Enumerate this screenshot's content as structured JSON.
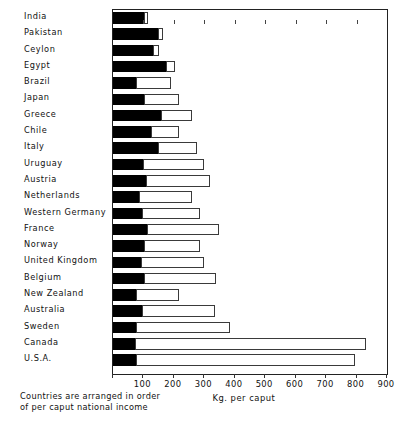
{
  "chart_data": {
    "type": "bar",
    "orientation": "horizontal",
    "stacked": true,
    "title": "",
    "xlabel": "Kg. per caput",
    "ylabel": "",
    "xlim": [
      0,
      900
    ],
    "xticks": [
      0,
      100,
      200,
      300,
      400,
      500,
      600,
      700,
      800,
      900
    ],
    "xtick_labels": [
      "",
      "100",
      "200",
      "300",
      "400",
      "500",
      "600",
      "700",
      "800",
      "900"
    ],
    "grid": false,
    "legend": [],
    "note": "Countries are arranged in order of per caput national income",
    "note_line1": "Countries are arranged in order",
    "note_line2": "of per caput national income",
    "categories": [
      "India",
      "Pakistan",
      "Ceylon",
      "Egypt",
      "Brazil",
      "Japan",
      "Greece",
      "Chile",
      "Italy",
      "Uruguay",
      "Austria",
      "Netherlands",
      "Western Germany",
      "France",
      "Norway",
      "United Kingdom",
      "Belgium",
      "New Zealand",
      "Australia",
      "Sweden",
      "Canada",
      "U.S.A."
    ],
    "series": [
      {
        "name": "dark-segment",
        "color": "#000000",
        "values": [
          102,
          148,
          131,
          174,
          75,
          102,
          158,
          125,
          148,
          99,
          108,
          85,
          95,
          112,
          102,
          92,
          102,
          75,
          95,
          75,
          72,
          75
        ]
      },
      {
        "name": "light-segment",
        "color": "#ffffff",
        "values": [
          13,
          16,
          20,
          30,
          115,
          115,
          102,
          92,
          128,
          200,
          212,
          174,
          191,
          236,
          184,
          207,
          236,
          142,
          240,
          309,
          760,
          720
        ]
      }
    ],
    "totals": [
      115,
      164,
      151,
      204,
      190,
      217,
      260,
      217,
      276,
      299,
      320,
      259,
      286,
      348,
      286,
      299,
      338,
      217,
      335,
      384,
      832,
      795
    ]
  }
}
